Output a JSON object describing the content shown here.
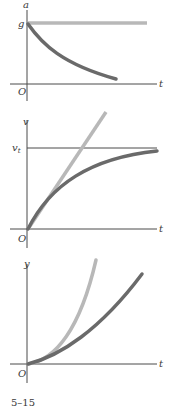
{
  "figure": {
    "caption": "5–15",
    "colors": {
      "axis": "#4a4a4a",
      "dark_curve": "#6a6a6a",
      "light_curve": "#b8b8b8",
      "text": "#3a3a3a"
    }
  },
  "panels": [
    {
      "name": "acceleration-vs-time",
      "y_label": "a",
      "x_label": "t",
      "origin_label": "O",
      "level_label": "g",
      "curves": [
        {
          "name": "no-drag",
          "shape": "constant at g",
          "color": "light"
        },
        {
          "name": "with-drag",
          "shape": "exponential decay from g toward 0",
          "color": "dark"
        }
      ]
    },
    {
      "name": "velocity-vs-time",
      "y_label": "v",
      "x_label": "t",
      "origin_label": "O",
      "level_label": "v",
      "level_label_sub": "t",
      "curves": [
        {
          "name": "no-drag",
          "shape": "linear increase from origin",
          "color": "light"
        },
        {
          "name": "with-drag",
          "shape": "rises and asymptotically approaches terminal velocity v_t",
          "color": "dark"
        }
      ]
    },
    {
      "name": "position-vs-time",
      "y_label": "y",
      "x_label": "t",
      "origin_label": "O",
      "curves": [
        {
          "name": "no-drag",
          "shape": "parabolic increase from origin",
          "color": "light"
        },
        {
          "name": "with-drag",
          "shape": "slower, nearly linear increase from origin",
          "color": "dark"
        }
      ]
    }
  ]
}
